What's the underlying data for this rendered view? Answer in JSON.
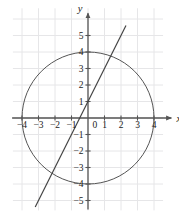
{
  "chart_data": {
    "type": "scatter",
    "title": "",
    "subtitle": "",
    "xlabel": "x",
    "ylabel": "y",
    "xlim": [
      -4.6,
      5.4
    ],
    "ylim": [
      -5.6,
      5.9
    ],
    "grid": true,
    "grid_spacing": 1,
    "legend": "none",
    "x_ticks": [
      -4,
      -3,
      -2,
      -1,
      0,
      1,
      2,
      3,
      4
    ],
    "x_tick_labels": [
      "-4",
      "-3",
      "-2",
      "-1",
      "0",
      "1",
      "2",
      "3",
      "4"
    ],
    "y_ticks": [
      -5,
      -4,
      -3,
      -2,
      -1,
      1,
      2,
      3,
      4,
      5
    ],
    "y_tick_labels": [
      "-5",
      "-4",
      "-3",
      "-2",
      "-1",
      "1",
      "2",
      "3",
      "4",
      "5"
    ],
    "origin_label": "0",
    "series": [
      {
        "name": "circle",
        "type": "circle",
        "equation": "x^2 + y^2 = 16",
        "center": [
          0,
          0
        ],
        "radius": 4,
        "color": "#555555",
        "linewidth": 1
      },
      {
        "name": "line",
        "type": "line",
        "equation": "y = 2x + 1",
        "slope": 2,
        "intercept": 1,
        "x_start": -3.2,
        "x_end": 2.3,
        "y_start": -5.4,
        "y_end": 5.6,
        "color": "#444444",
        "linewidth": 1.2
      }
    ],
    "axis_color": "#555555",
    "grid_color": "#e6e6e8",
    "background": "#ffffff"
  },
  "axes": {
    "x_axis_name": "x",
    "y_axis_name": "y"
  }
}
